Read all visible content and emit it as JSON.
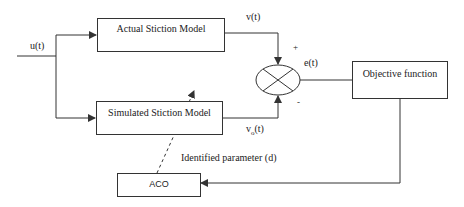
{
  "diagram": {
    "input_label": "u(t)",
    "blocks": {
      "actual": "Actual Stiction Model",
      "simulated": "Simulated Stiction Model",
      "objective": "Objective function",
      "aco": "ACO"
    },
    "signals": {
      "actual_output": "v(t)",
      "simulated_output_base": "v",
      "simulated_output_sub": "o",
      "simulated_output_suffix": "(t)",
      "error": "e(t)",
      "identified_parameter": "Identified parameter (d)"
    },
    "summing_junction": {
      "plus_sign": "+",
      "minus_sign": "-"
    },
    "colors": {
      "line": "#333333",
      "text": "#222222",
      "background": "#ffffff"
    }
  }
}
